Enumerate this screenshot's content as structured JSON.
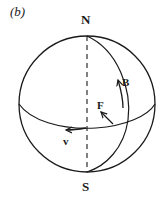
{
  "figure": {
    "panel_label": "(b)",
    "poles": {
      "north": "N",
      "south": "S"
    },
    "vectors": {
      "B": "B",
      "F": "F",
      "v": "v"
    },
    "colors": {
      "line": "#1a1a1a",
      "background": "#ffffff"
    }
  }
}
